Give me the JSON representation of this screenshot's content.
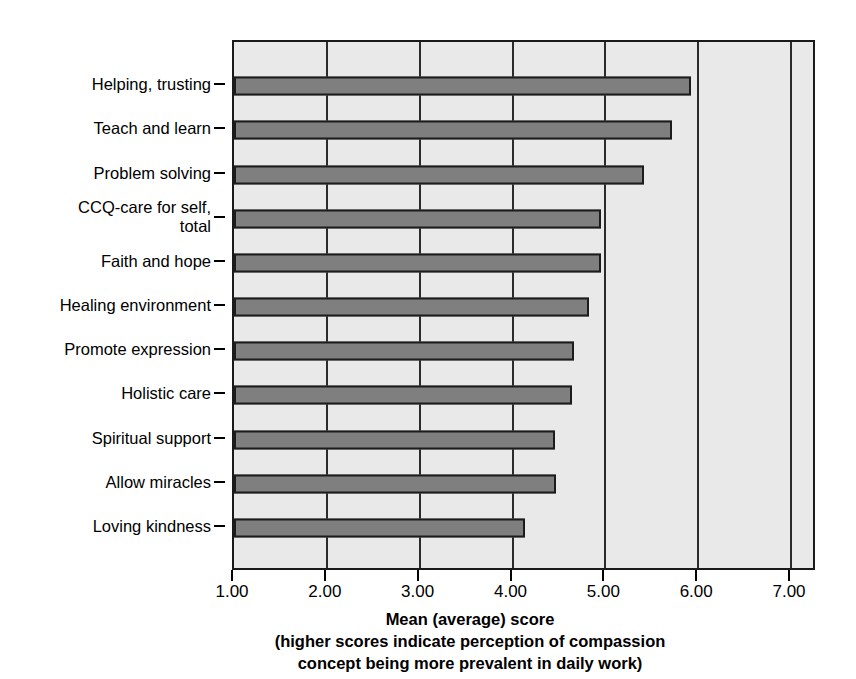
{
  "chart_data": {
    "type": "bar",
    "orientation": "horizontal",
    "title": "",
    "xlabel": "Mean (average) score",
    "xlabel_lines": [
      "Mean (average) score",
      "(higher scores indicate perception of compassion",
      "concept being more prevalent in daily work)"
    ],
    "ylabel": "",
    "categories": [
      "Helping, trusting",
      "Teach and learn",
      "Problem solving",
      "CCQ-care for self,\ntotal",
      "Faith and hope",
      "Healing environment",
      "Promote expression",
      "Holistic care",
      "Spiritual support",
      "Allow miracles",
      "Loving kindness"
    ],
    "values": [
      5.92,
      5.72,
      5.42,
      4.95,
      4.95,
      4.82,
      4.66,
      4.64,
      4.46,
      4.47,
      4.13
    ],
    "xlim": [
      1.0,
      7.28
    ],
    "xticks": [
      1.0,
      2.0,
      3.0,
      4.0,
      5.0,
      6.0,
      7.0
    ],
    "xtick_labels": [
      "1.00",
      "2.00",
      "3.00",
      "4.00",
      "5.00",
      "6.00",
      "7.00"
    ],
    "grid": true,
    "grid_axis": "x",
    "legend": null,
    "colors": {
      "bar_fill": "#7f7f7f",
      "bar_border": "#1c1c1c",
      "plot_background": "#e9e9e9",
      "axis": "#1a1a1a",
      "text": "#000000"
    }
  }
}
